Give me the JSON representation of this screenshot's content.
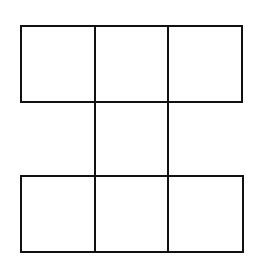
{
  "diagram": {
    "type": "square-net",
    "stroke_color": "#111111",
    "background": "#ffffff",
    "cells": [
      {
        "row": 0,
        "col": 0,
        "x": 21,
        "y": 26,
        "w": 74,
        "h": 76
      },
      {
        "row": 0,
        "col": 1,
        "x": 95,
        "y": 26,
        "w": 73,
        "h": 76
      },
      {
        "row": 0,
        "col": 2,
        "x": 168,
        "y": 26,
        "w": 74,
        "h": 76
      },
      {
        "row": 1,
        "col": 1,
        "x": 95,
        "y": 102,
        "w": 73,
        "h": 74
      },
      {
        "row": 2,
        "col": 0,
        "x": 21,
        "y": 176,
        "w": 74,
        "h": 76
      },
      {
        "row": 2,
        "col": 1,
        "x": 95,
        "y": 176,
        "w": 73,
        "h": 76
      },
      {
        "row": 2,
        "col": 2,
        "x": 168,
        "y": 176,
        "w": 75,
        "h": 76
      }
    ]
  }
}
